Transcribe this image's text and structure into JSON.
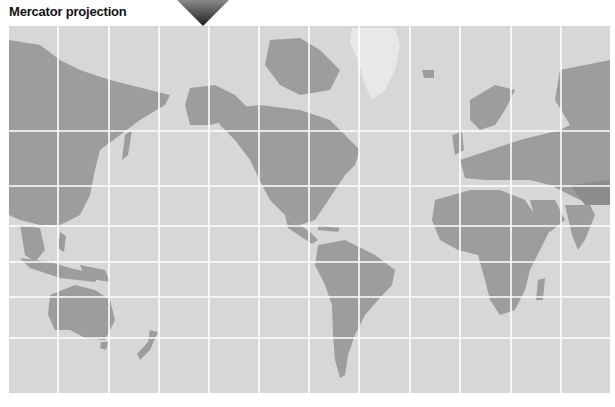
{
  "title": "Mercator projection",
  "map": {
    "projection": "Mercator",
    "ocean_color": "#d7d7d7",
    "land_color": "#9a9a9a",
    "gridline_color": "#ffffff",
    "grid": {
      "columns": 12,
      "rows": 7,
      "vertical_lines_x": [
        58,
        109,
        159,
        209,
        259,
        309,
        359,
        410,
        460,
        511,
        561
      ],
      "horizontal_lines_y": [
        131,
        186,
        226,
        262,
        297,
        338
      ]
    },
    "pointer": {
      "icon": "triangle-down-marker",
      "x": 203
    }
  }
}
